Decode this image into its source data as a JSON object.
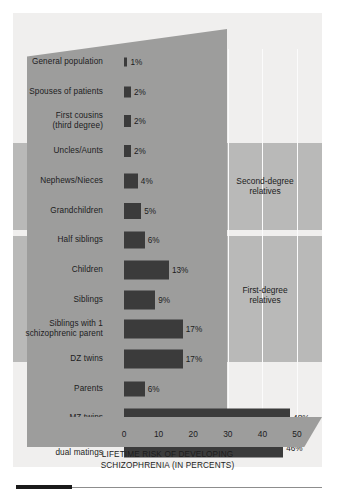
{
  "chart_data": {
    "type": "bar",
    "orientation": "horizontal",
    "title": "",
    "xlabel": "LIFETIME RISK OF DEVELOPING\nSCHIZOPHRENIA (IN PERCENTS)",
    "ylabel": "",
    "xlim": [
      0,
      50
    ],
    "xticks": [
      0,
      10,
      20,
      30,
      40,
      50
    ],
    "xtick_labels": [
      "0",
      "10",
      "20",
      "30",
      "40",
      "50"
    ],
    "grid": true,
    "grid_axis": "x",
    "legend": "none",
    "bar_color": "#3b3b3b",
    "categories": [
      "General population",
      "Spouses of patients",
      "First cousins\n(third degree)",
      "Uncles/Aunts",
      "Nephews/Nieces",
      "Grandchildren",
      "Half siblings",
      "Children",
      "Siblings",
      "Siblings with 1\nschizophrenic parent",
      "DZ twins",
      "Parents",
      "MZ twins",
      "Offspring of\ndual matings"
    ],
    "values": [
      1,
      2,
      2,
      2,
      4,
      5,
      6,
      13,
      9,
      17,
      17,
      6,
      48,
      46
    ],
    "value_labels": [
      "1%",
      "2%",
      "2%",
      "2%",
      "4%",
      "5%",
      "6%",
      "13%",
      "9%",
      "17%",
      "17%",
      "6%",
      "48%",
      "46%"
    ],
    "annotations": [
      {
        "text": "Second-degree\nrelatives",
        "covers_rows": [
          3,
          4,
          5,
          6
        ]
      },
      {
        "text": "First-degree\nrelatives",
        "covers_rows": [
          7,
          8,
          9,
          10,
          11
        ]
      }
    ]
  },
  "colors": {
    "figure_background": "#ededec",
    "plot_background": "#f0efee",
    "label_panel": "#9d9d9c",
    "group_band": "#b9b9b8",
    "bar": "#3b3b3b",
    "gridline": "#fbfbfb",
    "text": "#1c1c1c",
    "rule_accent": "#1a1a1a"
  },
  "rows": [
    {
      "label": "General population",
      "value_label": "1%"
    },
    {
      "label": "Spouses of patients",
      "value_label": "2%"
    },
    {
      "label": "First cousins\n(third degree)",
      "value_label": "2%"
    },
    {
      "label": "Uncles/Aunts",
      "value_label": "2%"
    },
    {
      "label": "Nephews/Nieces",
      "value_label": "4%"
    },
    {
      "label": "Grandchildren",
      "value_label": "5%"
    },
    {
      "label": "Half siblings",
      "value_label": "6%"
    },
    {
      "label": "Children",
      "value_label": "13%"
    },
    {
      "label": "Siblings",
      "value_label": "9%"
    },
    {
      "label": "Siblings with 1\nschizophrenic parent",
      "value_label": "17%"
    },
    {
      "label": "DZ twins",
      "value_label": "17%"
    },
    {
      "label": "Parents",
      "value_label": "6%"
    },
    {
      "label": "MZ twins",
      "value_label": "48%"
    },
    {
      "label": "Offspring of\ndual matings",
      "value_label": "46%"
    }
  ],
  "groups": {
    "second_degree": "Second-degree\nrelatives",
    "first_degree": "First-degree\nrelatives"
  },
  "axis": {
    "ticks": [
      "0",
      "10",
      "20",
      "30",
      "40",
      "50"
    ],
    "title": "LIFETIME RISK OF DEVELOPING\nSCHIZOPHRENIA (IN PERCENTS)"
  }
}
